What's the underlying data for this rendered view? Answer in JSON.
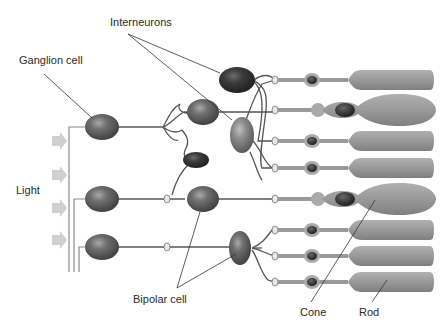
{
  "labels": {
    "interneurons": "Interneurons",
    "ganglion": "Ganglion cell",
    "light": "Light",
    "bipolar": "Bipolar cell",
    "cone": "Cone",
    "rod": "Rod"
  },
  "colors": {
    "background": "#ffffff",
    "cell_body": "#6e6e6e",
    "cell_dark": "#3a3a3a",
    "photoreceptor": "#9a9a9a",
    "photoreceptor_edge": "#7d7d7d",
    "nucleus": "#333333",
    "axon": "#555555",
    "light_arrow": "#cfcfcf",
    "leader_line": "#333333"
  },
  "photoreceptors": [
    {
      "type": "rod",
      "y": 80
    },
    {
      "type": "cone",
      "y": 110
    },
    {
      "type": "rod",
      "y": 141
    },
    {
      "type": "rod",
      "y": 168
    },
    {
      "type": "cone",
      "y": 199
    },
    {
      "type": "rod",
      "y": 230
    },
    {
      "type": "rod",
      "y": 256
    },
    {
      "type": "rod",
      "y": 282
    }
  ],
  "ganglion_cells": [
    {
      "x": 102,
      "y": 127
    },
    {
      "x": 102,
      "y": 199
    },
    {
      "x": 102,
      "y": 247
    }
  ],
  "bipolar_cells": [
    {
      "x": 203,
      "y": 112
    },
    {
      "x": 203,
      "y": 199
    },
    {
      "x": 240,
      "y": 248
    }
  ],
  "light_arrows_y": [
    141,
    175,
    208,
    240
  ]
}
